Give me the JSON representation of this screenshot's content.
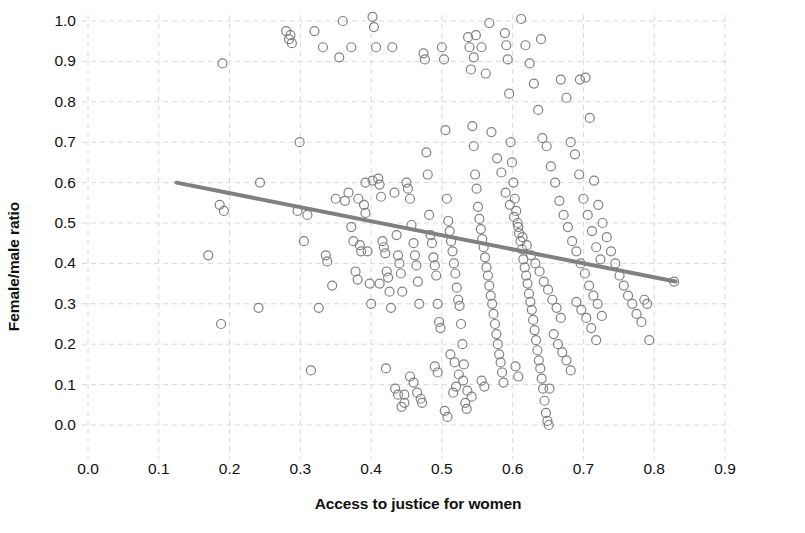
{
  "chart_data": {
    "type": "scatter",
    "title": "",
    "xlabel": "Access to justice for women",
    "ylabel": "Female/male ratio",
    "xlim": [
      0.0,
      0.9
    ],
    "ylim": [
      0.0,
      1.0
    ],
    "xticks": [
      "0.0",
      "0.1",
      "0.2",
      "0.3",
      "0.4",
      "0.5",
      "0.6",
      "0.7",
      "0.8",
      "0.9"
    ],
    "yticks": [
      "0.0",
      "0.1",
      "0.2",
      "0.3",
      "0.4",
      "0.5",
      "0.6",
      "0.7",
      "0.8",
      "0.9",
      "1.0"
    ],
    "xtick_values": [
      0.0,
      0.1,
      0.2,
      0.3,
      0.4,
      0.5,
      0.6,
      0.7,
      0.8,
      0.9
    ],
    "ytick_values": [
      0.0,
      0.1,
      0.2,
      0.3,
      0.4,
      0.5,
      0.6,
      0.7,
      0.8,
      0.9,
      1.0
    ],
    "grid": true,
    "grid_style": "dashed",
    "grid_color": "#d9d9d9",
    "legend": null,
    "marker": {
      "shape": "circle",
      "filled": false,
      "edge_color": "#808080",
      "face_color": "none",
      "size_px": 9,
      "edge_width": 1.2
    },
    "trendline": {
      "type": "linear",
      "color": "#808080",
      "width_px": 4,
      "x_start": 0.125,
      "y_start": 0.6,
      "x_end": 0.83,
      "y_end": 0.355,
      "slope": -0.3475,
      "intercept": 0.6434
    },
    "n_points": 261,
    "points": [
      [
        0.19,
        0.895
      ],
      [
        0.17,
        0.42
      ],
      [
        0.186,
        0.545
      ],
      [
        0.192,
        0.53
      ],
      [
        0.188,
        0.25
      ],
      [
        0.243,
        0.6
      ],
      [
        0.241,
        0.29
      ],
      [
        0.28,
        0.975
      ],
      [
        0.284,
        0.955
      ],
      [
        0.286,
        0.965
      ],
      [
        0.288,
        0.945
      ],
      [
        0.299,
        0.7
      ],
      [
        0.296,
        0.53
      ],
      [
        0.305,
        0.455
      ],
      [
        0.31,
        0.52
      ],
      [
        0.315,
        0.135
      ],
      [
        0.32,
        0.975
      ],
      [
        0.326,
        0.29
      ],
      [
        0.332,
        0.935
      ],
      [
        0.336,
        0.42
      ],
      [
        0.338,
        0.405
      ],
      [
        0.345,
        0.345
      ],
      [
        0.35,
        0.56
      ],
      [
        0.355,
        0.91
      ],
      [
        0.36,
        1.0
      ],
      [
        0.363,
        0.555
      ],
      [
        0.368,
        0.575
      ],
      [
        0.372,
        0.49
      ],
      [
        0.375,
        0.455
      ],
      [
        0.378,
        0.38
      ],
      [
        0.381,
        0.36
      ],
      [
        0.384,
        0.445
      ],
      [
        0.386,
        0.43
      ],
      [
        0.39,
        0.545
      ],
      [
        0.392,
        0.525
      ],
      [
        0.395,
        0.43
      ],
      [
        0.398,
        0.35
      ],
      [
        0.4,
        0.3
      ],
      [
        0.402,
        1.01
      ],
      [
        0.404,
        0.985
      ],
      [
        0.407,
        0.935
      ],
      [
        0.41,
        0.61
      ],
      [
        0.412,
        0.595
      ],
      [
        0.414,
        0.565
      ],
      [
        0.416,
        0.455
      ],
      [
        0.418,
        0.44
      ],
      [
        0.42,
        0.425
      ],
      [
        0.422,
        0.38
      ],
      [
        0.424,
        0.365
      ],
      [
        0.426,
        0.33
      ],
      [
        0.428,
        0.29
      ],
      [
        0.43,
        0.935
      ],
      [
        0.433,
        0.575
      ],
      [
        0.436,
        0.47
      ],
      [
        0.438,
        0.42
      ],
      [
        0.44,
        0.4
      ],
      [
        0.442,
        0.375
      ],
      [
        0.444,
        0.33
      ],
      [
        0.447,
        0.075
      ],
      [
        0.45,
        0.6
      ],
      [
        0.452,
        0.585
      ],
      [
        0.455,
        0.56
      ],
      [
        0.457,
        0.495
      ],
      [
        0.46,
        0.45
      ],
      [
        0.462,
        0.42
      ],
      [
        0.464,
        0.395
      ],
      [
        0.466,
        0.355
      ],
      [
        0.468,
        0.3
      ],
      [
        0.47,
        0.065
      ],
      [
        0.472,
        0.055
      ],
      [
        0.474,
        0.92
      ],
      [
        0.476,
        0.905
      ],
      [
        0.478,
        0.675
      ],
      [
        0.48,
        0.62
      ],
      [
        0.482,
        0.52
      ],
      [
        0.484,
        0.47
      ],
      [
        0.486,
        0.45
      ],
      [
        0.488,
        0.415
      ],
      [
        0.49,
        0.395
      ],
      [
        0.492,
        0.37
      ],
      [
        0.494,
        0.3
      ],
      [
        0.496,
        0.255
      ],
      [
        0.498,
        0.24
      ],
      [
        0.5,
        0.935
      ],
      [
        0.503,
        0.905
      ],
      [
        0.505,
        0.73
      ],
      [
        0.507,
        0.56
      ],
      [
        0.509,
        0.505
      ],
      [
        0.511,
        0.48
      ],
      [
        0.513,
        0.455
      ],
      [
        0.515,
        0.43
      ],
      [
        0.517,
        0.4
      ],
      [
        0.519,
        0.375
      ],
      [
        0.521,
        0.34
      ],
      [
        0.523,
        0.31
      ],
      [
        0.525,
        0.295
      ],
      [
        0.527,
        0.25
      ],
      [
        0.529,
        0.2
      ],
      [
        0.531,
        0.15
      ],
      [
        0.533,
        0.055
      ],
      [
        0.535,
        0.04
      ],
      [
        0.537,
        0.96
      ],
      [
        0.539,
        0.935
      ],
      [
        0.541,
        0.88
      ],
      [
        0.543,
        0.74
      ],
      [
        0.545,
        0.69
      ],
      [
        0.547,
        0.62
      ],
      [
        0.549,
        0.585
      ],
      [
        0.551,
        0.54
      ],
      [
        0.553,
        0.51
      ],
      [
        0.555,
        0.485
      ],
      [
        0.557,
        0.46
      ],
      [
        0.559,
        0.44
      ],
      [
        0.561,
        0.415
      ],
      [
        0.563,
        0.39
      ],
      [
        0.565,
        0.37
      ],
      [
        0.567,
        0.345
      ],
      [
        0.569,
        0.32
      ],
      [
        0.571,
        0.3
      ],
      [
        0.573,
        0.275
      ],
      [
        0.575,
        0.25
      ],
      [
        0.577,
        0.225
      ],
      [
        0.579,
        0.2
      ],
      [
        0.581,
        0.175
      ],
      [
        0.583,
        0.155
      ],
      [
        0.585,
        0.13
      ],
      [
        0.587,
        0.105
      ],
      [
        0.589,
        0.97
      ],
      [
        0.591,
        0.94
      ],
      [
        0.593,
        0.905
      ],
      [
        0.595,
        0.82
      ],
      [
        0.597,
        0.7
      ],
      [
        0.599,
        0.65
      ],
      [
        0.601,
        0.6
      ],
      [
        0.603,
        0.56
      ],
      [
        0.605,
        0.53
      ],
      [
        0.607,
        0.5
      ],
      [
        0.609,
        0.475
      ],
      [
        0.611,
        0.455
      ],
      [
        0.613,
        0.435
      ],
      [
        0.615,
        0.41
      ],
      [
        0.617,
        0.39
      ],
      [
        0.619,
        0.37
      ],
      [
        0.621,
        0.35
      ],
      [
        0.623,
        0.325
      ],
      [
        0.625,
        0.305
      ],
      [
        0.627,
        0.285
      ],
      [
        0.629,
        0.26
      ],
      [
        0.631,
        0.235
      ],
      [
        0.633,
        0.21
      ],
      [
        0.635,
        0.185
      ],
      [
        0.637,
        0.16
      ],
      [
        0.639,
        0.14
      ],
      [
        0.641,
        0.115
      ],
      [
        0.643,
        0.09
      ],
      [
        0.645,
        0.06
      ],
      [
        0.647,
        0.03
      ],
      [
        0.649,
        0.01
      ],
      [
        0.651,
        0.0
      ],
      [
        0.545,
        0.91
      ],
      [
        0.548,
        0.965
      ],
      [
        0.556,
        0.935
      ],
      [
        0.562,
        0.87
      ],
      [
        0.57,
        0.725
      ],
      [
        0.578,
        0.66
      ],
      [
        0.584,
        0.625
      ],
      [
        0.59,
        0.575
      ],
      [
        0.596,
        0.545
      ],
      [
        0.602,
        0.515
      ],
      [
        0.608,
        0.49
      ],
      [
        0.614,
        0.465
      ],
      [
        0.62,
        0.445
      ],
      [
        0.626,
        0.42
      ],
      [
        0.632,
        0.4
      ],
      [
        0.638,
        0.38
      ],
      [
        0.644,
        0.355
      ],
      [
        0.65,
        0.335
      ],
      [
        0.656,
        0.31
      ],
      [
        0.662,
        0.29
      ],
      [
        0.668,
        0.265
      ],
      [
        0.612,
        1.005
      ],
      [
        0.618,
        0.94
      ],
      [
        0.624,
        0.895
      ],
      [
        0.63,
        0.845
      ],
      [
        0.636,
        0.78
      ],
      [
        0.642,
        0.71
      ],
      [
        0.648,
        0.69
      ],
      [
        0.654,
        0.64
      ],
      [
        0.66,
        0.6
      ],
      [
        0.666,
        0.555
      ],
      [
        0.672,
        0.52
      ],
      [
        0.678,
        0.49
      ],
      [
        0.684,
        0.455
      ],
      [
        0.69,
        0.43
      ],
      [
        0.696,
        0.4
      ],
      [
        0.702,
        0.375
      ],
      [
        0.708,
        0.345
      ],
      [
        0.714,
        0.32
      ],
      [
        0.72,
        0.3
      ],
      [
        0.726,
        0.27
      ],
      [
        0.668,
        0.855
      ],
      [
        0.676,
        0.81
      ],
      [
        0.682,
        0.7
      ],
      [
        0.688,
        0.67
      ],
      [
        0.694,
        0.62
      ],
      [
        0.7,
        0.56
      ],
      [
        0.706,
        0.52
      ],
      [
        0.712,
        0.48
      ],
      [
        0.718,
        0.44
      ],
      [
        0.724,
        0.41
      ],
      [
        0.695,
        0.855
      ],
      [
        0.703,
        0.86
      ],
      [
        0.709,
        0.76
      ],
      [
        0.715,
        0.605
      ],
      [
        0.721,
        0.545
      ],
      [
        0.727,
        0.5
      ],
      [
        0.733,
        0.465
      ],
      [
        0.739,
        0.43
      ],
      [
        0.745,
        0.4
      ],
      [
        0.751,
        0.37
      ],
      [
        0.69,
        0.305
      ],
      [
        0.697,
        0.285
      ],
      [
        0.704,
        0.265
      ],
      [
        0.711,
        0.24
      ],
      [
        0.718,
        0.21
      ],
      [
        0.757,
        0.345
      ],
      [
        0.763,
        0.32
      ],
      [
        0.769,
        0.3
      ],
      [
        0.775,
        0.275
      ],
      [
        0.782,
        0.255
      ],
      [
        0.786,
        0.31
      ],
      [
        0.79,
        0.3
      ],
      [
        0.793,
        0.21
      ],
      [
        0.828,
        0.355
      ],
      [
        0.64,
        0.955
      ],
      [
        0.567,
        0.995
      ],
      [
        0.52,
        0.095
      ],
      [
        0.516,
        0.08
      ],
      [
        0.556,
        0.11
      ],
      [
        0.56,
        0.095
      ],
      [
        0.604,
        0.145
      ],
      [
        0.608,
        0.12
      ],
      [
        0.455,
        0.12
      ],
      [
        0.46,
        0.105
      ],
      [
        0.465,
        0.08
      ],
      [
        0.447,
        0.055
      ],
      [
        0.443,
        0.045
      ],
      [
        0.504,
        0.035
      ],
      [
        0.508,
        0.02
      ],
      [
        0.652,
        0.09
      ],
      [
        0.658,
        0.225
      ],
      [
        0.664,
        0.2
      ],
      [
        0.67,
        0.18
      ],
      [
        0.676,
        0.16
      ],
      [
        0.682,
        0.135
      ],
      [
        0.372,
        0.935
      ],
      [
        0.382,
        0.56
      ],
      [
        0.392,
        0.6
      ],
      [
        0.402,
        0.605
      ],
      [
        0.412,
        0.35
      ],
      [
        0.421,
        0.14
      ],
      [
        0.434,
        0.09
      ],
      [
        0.438,
        0.075
      ],
      [
        0.49,
        0.145
      ],
      [
        0.494,
        0.13
      ],
      [
        0.512,
        0.175
      ],
      [
        0.518,
        0.155
      ],
      [
        0.524,
        0.125
      ],
      [
        0.53,
        0.11
      ],
      [
        0.536,
        0.085
      ],
      [
        0.542,
        0.07
      ]
    ]
  }
}
